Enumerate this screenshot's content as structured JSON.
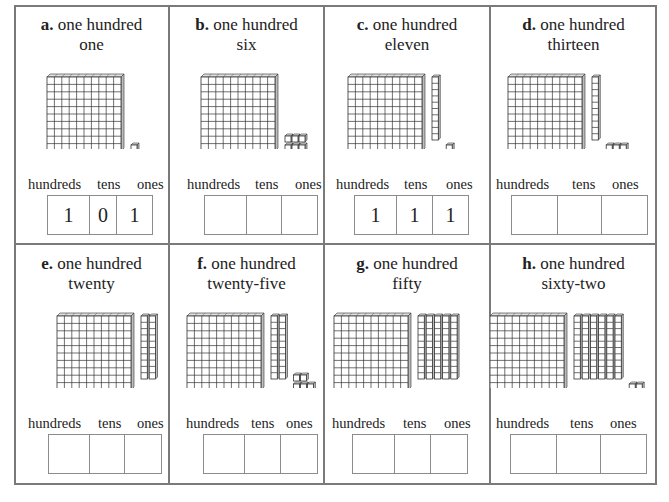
{
  "worksheet": {
    "column_labels": {
      "hundreds": "hundreds",
      "tens": "tens",
      "ones": "ones"
    },
    "problems": [
      {
        "letter": "a.",
        "line1": "one hundred",
        "line2": "one",
        "hundreds": 1,
        "tens": 0,
        "ones": 1,
        "answer": {
          "hundreds": "1",
          "tens": "0",
          "ones": "1"
        }
      },
      {
        "letter": "b.",
        "line1": "one hundred",
        "line2": "six",
        "hundreds": 1,
        "tens": 0,
        "ones": 6,
        "answer": {
          "hundreds": "",
          "tens": "",
          "ones": ""
        }
      },
      {
        "letter": "c.",
        "line1": "one hundred",
        "line2": "eleven",
        "hundreds": 1,
        "tens": 1,
        "ones": 1,
        "answer": {
          "hundreds": "1",
          "tens": "1",
          "ones": "1"
        }
      },
      {
        "letter": "d.",
        "line1": "one hundred",
        "line2": "thirteen",
        "hundreds": 1,
        "tens": 1,
        "ones": 3,
        "answer": {
          "hundreds": "",
          "tens": "",
          "ones": ""
        }
      },
      {
        "letter": "e.",
        "line1": "one hundred",
        "line2": "twenty",
        "hundreds": 1,
        "tens": 2,
        "ones": 0,
        "answer": {
          "hundreds": "",
          "tens": "",
          "ones": ""
        }
      },
      {
        "letter": "f.",
        "line1": "one hundred",
        "line2": "twenty-five",
        "hundreds": 1,
        "tens": 2,
        "ones": 5,
        "answer": {
          "hundreds": "",
          "tens": "",
          "ones": ""
        }
      },
      {
        "letter": "g.",
        "line1": "one hundred",
        "line2": "fifty",
        "hundreds": 1,
        "tens": 5,
        "ones": 0,
        "answer": {
          "hundreds": "",
          "tens": "",
          "ones": ""
        }
      },
      {
        "letter": "h.",
        "line1": "one hundred",
        "line2": "sixty-two",
        "hundreds": 1,
        "tens": 6,
        "ones": 2,
        "answer": {
          "hundreds": "",
          "tens": "",
          "ones": ""
        }
      }
    ]
  },
  "colors": {
    "border": "#7a7a7a",
    "block_line": "#333333",
    "block_side": "#bdbdbd",
    "box_border": "#8c8c8c"
  }
}
